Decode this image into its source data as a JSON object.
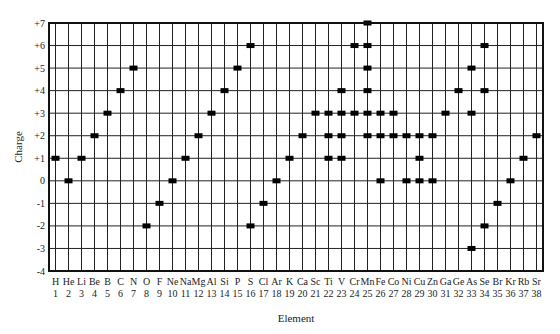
{
  "chart_data": {
    "type": "scatter",
    "title": "",
    "xlabel": "Element",
    "ylabel": "Charge",
    "ylim": [
      -4,
      7
    ],
    "yticks": [
      "+7",
      "+6",
      "+5",
      "+4",
      "+3",
      "+2",
      "+1",
      "0",
      "-1",
      "-2",
      "-3",
      "-4"
    ],
    "grid": true,
    "legend": "none",
    "elements": [
      {
        "symbol": "H",
        "number": 1,
        "charges": [
          1
        ]
      },
      {
        "symbol": "He",
        "number": 2,
        "charges": [
          0
        ]
      },
      {
        "symbol": "Li",
        "number": 3,
        "charges": [
          1
        ]
      },
      {
        "symbol": "Be",
        "number": 4,
        "charges": [
          2
        ]
      },
      {
        "symbol": "B",
        "number": 5,
        "charges": [
          3
        ]
      },
      {
        "symbol": "C",
        "number": 6,
        "charges": [
          4
        ]
      },
      {
        "symbol": "N",
        "number": 7,
        "charges": [
          5
        ]
      },
      {
        "symbol": "O",
        "number": 8,
        "charges": [
          -2
        ]
      },
      {
        "symbol": "F",
        "number": 9,
        "charges": [
          -1
        ]
      },
      {
        "symbol": "Ne",
        "number": 10,
        "charges": [
          0
        ]
      },
      {
        "symbol": "Na",
        "number": 11,
        "charges": [
          1
        ]
      },
      {
        "symbol": "Mg",
        "number": 12,
        "charges": [
          2
        ]
      },
      {
        "symbol": "Al",
        "number": 13,
        "charges": [
          3
        ]
      },
      {
        "symbol": "Si",
        "number": 14,
        "charges": [
          4
        ]
      },
      {
        "symbol": "P",
        "number": 15,
        "charges": [
          5
        ]
      },
      {
        "symbol": "S",
        "number": 16,
        "charges": [
          6,
          -2
        ]
      },
      {
        "symbol": "Cl",
        "number": 17,
        "charges": [
          -1
        ]
      },
      {
        "symbol": "Ar",
        "number": 18,
        "charges": [
          0
        ]
      },
      {
        "symbol": "K",
        "number": 19,
        "charges": [
          1
        ]
      },
      {
        "symbol": "Ca",
        "number": 20,
        "charges": [
          2
        ]
      },
      {
        "symbol": "Sc",
        "number": 21,
        "charges": [
          3
        ]
      },
      {
        "symbol": "Ti",
        "number": 22,
        "charges": [
          1,
          2,
          3
        ]
      },
      {
        "symbol": "V",
        "number": 23,
        "charges": [
          1,
          2,
          3,
          4
        ]
      },
      {
        "symbol": "Cr",
        "number": 24,
        "charges": [
          3,
          6
        ]
      },
      {
        "symbol": "Mn",
        "number": 25,
        "charges": [
          2,
          3,
          4,
          5,
          6,
          7
        ]
      },
      {
        "symbol": "Fe",
        "number": 26,
        "charges": [
          0,
          2,
          3
        ]
      },
      {
        "symbol": "Co",
        "number": 27,
        "charges": [
          2,
          3
        ]
      },
      {
        "symbol": "Ni",
        "number": 28,
        "charges": [
          0,
          2
        ]
      },
      {
        "symbol": "Cu",
        "number": 29,
        "charges": [
          0,
          1,
          2
        ]
      },
      {
        "symbol": "Zn",
        "number": 30,
        "charges": [
          0,
          2
        ]
      },
      {
        "symbol": "Ga",
        "number": 31,
        "charges": [
          3
        ]
      },
      {
        "symbol": "Ge",
        "number": 32,
        "charges": [
          4
        ]
      },
      {
        "symbol": "As",
        "number": 33,
        "charges": [
          3,
          5,
          -3
        ]
      },
      {
        "symbol": "Se",
        "number": 34,
        "charges": [
          4,
          6,
          -2
        ]
      },
      {
        "symbol": "Br",
        "number": 35,
        "charges": [
          -1
        ]
      },
      {
        "symbol": "Kr",
        "number": 36,
        "charges": [
          0
        ]
      },
      {
        "symbol": "Rb",
        "number": 37,
        "charges": [
          1
        ]
      },
      {
        "symbol": "Sr",
        "number": 38,
        "charges": [
          2
        ]
      }
    ]
  },
  "colors": {
    "grid": "#222222",
    "marker": "#000000",
    "text": "#222222"
  }
}
